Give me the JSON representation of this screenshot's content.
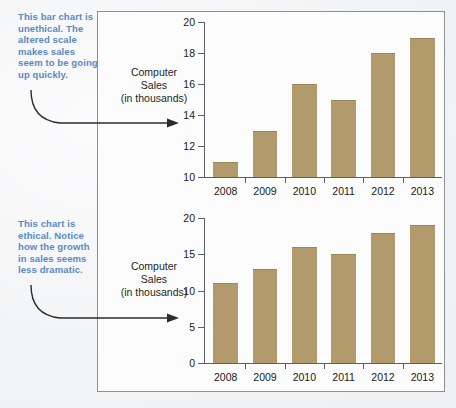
{
  "figure": {
    "bar_color": "#b29a6c",
    "annotation_color": "#5b89c4",
    "axis_color": "#5c6064",
    "frame_color": "#8d9196"
  },
  "annotations": {
    "top": "This bar chart is unethical. The altered scale makes sales seem to be going up quickly.",
    "bottom": "This chart is ethical. Notice how the growth in sales seems less dramatic."
  },
  "charts": [
    {
      "id": "unethical",
      "axis_title": "Computer Sales (in thousands)",
      "axis_title_lines": [
        "Computer",
        "Sales",
        "(in thousands)"
      ],
      "ytick_labels": [
        "20",
        "18",
        "16",
        "14",
        "12",
        "10"
      ]
    },
    {
      "id": "ethical",
      "axis_title": "Computer Sales (in thousands)",
      "axis_title_lines": [
        "Computer",
        "Sales",
        "(in thousands)"
      ],
      "ytick_labels": [
        "20",
        "15",
        "10",
        "5",
        "0"
      ]
    }
  ],
  "chart_data": [
    {
      "type": "bar",
      "id": "unethical-truncated-axis",
      "title": "",
      "xlabel": "",
      "ylabel": "Computer Sales (in thousands)",
      "categories": [
        "2008",
        "2009",
        "2010",
        "2011",
        "2012",
        "2013"
      ],
      "values": [
        11,
        13,
        16,
        15,
        18,
        19
      ],
      "ylim": [
        10,
        20
      ],
      "yticks": [
        10,
        12,
        14,
        16,
        18,
        20
      ],
      "grid": false,
      "legend": "none",
      "bar_color": "#b29a6c",
      "note": "Truncated y-axis starting at 10 exaggerates growth"
    },
    {
      "type": "bar",
      "id": "ethical-zero-baseline",
      "title": "",
      "xlabel": "",
      "ylabel": "Computer Sales (in thousands)",
      "categories": [
        "2008",
        "2009",
        "2010",
        "2011",
        "2012",
        "2013"
      ],
      "values": [
        11,
        13,
        16,
        15,
        18,
        19
      ],
      "ylim": [
        0,
        20
      ],
      "yticks": [
        0,
        5,
        10,
        15,
        20
      ],
      "grid": false,
      "legend": "none",
      "bar_color": "#b29a6c",
      "note": "Zero-baseline y-axis shows modest growth"
    }
  ]
}
